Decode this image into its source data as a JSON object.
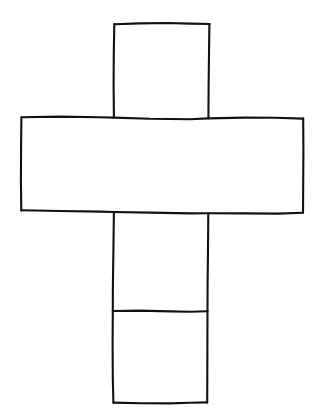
{
  "document": {
    "title": "Cube net drawing",
    "description": "Hand-drawn line figure of an unfolded cube (Latin cross net) composed of six squares",
    "background_color": "#ffffff",
    "ink_color": "#111111",
    "canvas": {
      "width": 315,
      "height": 418
    }
  },
  "figure": {
    "kind": "line-drawing",
    "layout": "latin-cross",
    "square_count": 6,
    "column_x": {
      "left": 113,
      "right": 208
    },
    "row_y": {
      "top": 23,
      "band_top": 118,
      "band_bottom": 212,
      "divider": 311,
      "bottom": 403
    },
    "band_x": {
      "left": 21,
      "right": 303
    },
    "stroke_width": 2.1,
    "faces": [
      {
        "name": "top-face",
        "label": "",
        "x": 113,
        "y": 23,
        "w": 96,
        "h": 95
      },
      {
        "name": "left-face",
        "label": "",
        "x": 21,
        "y": 117,
        "w": 92,
        "h": 95
      },
      {
        "name": "front-face",
        "label": "",
        "x": 113,
        "y": 118,
        "w": 95,
        "h": 94
      },
      {
        "name": "right-face",
        "label": "",
        "x": 208,
        "y": 118,
        "w": 95,
        "h": 94
      },
      {
        "name": "bottom-face",
        "label": "",
        "x": 113,
        "y": 212,
        "w": 95,
        "h": 99
      },
      {
        "name": "back-face",
        "label": "",
        "x": 113,
        "y": 311,
        "w": 94,
        "h": 92
      }
    ],
    "strokes": [
      {
        "name": "top-square-top-edge",
        "d": "M 114.5 24.2 L 140 23.4 L 168 23.0 L 190 23.6 L 209.5 24.0"
      },
      {
        "name": "top-square-left-edge",
        "d": "M 114.3 24.0 L 113.8 52 L 113.6 84 L 113.9 117.6"
      },
      {
        "name": "top-square-right-edge",
        "d": "M 209.4 24.0 L 209.0 54 L 208.6 88 L 208.4 118.2"
      },
      {
        "name": "band-top-edge",
        "d": "M 21.6 117.2 L 60 116.6 L 100 117.2 L 114 117.6 L 150 118.8 L 190 119.2 L 208 118.4 L 245 117.6 L 275 117.8 L 303.2 118.6"
      },
      {
        "name": "band-left-edge",
        "d": "M 21.4 117.2 L 21.1 145 L 20.9 180 L 21.3 210.6"
      },
      {
        "name": "band-right-edge",
        "d": "M 303.2 118.6 L 303.4 150 L 303.2 185 L 303.0 212.8"
      },
      {
        "name": "band-bottom-edge",
        "d": "M 21.3 210.2 L 60 211.0 L 100 211.6 L 113 212.0 L 150 212.6 L 190 213.4 L 208 213.2 L 245 213.4 L 278 213.6 L 303.0 212.8"
      },
      {
        "name": "lower-column-left-edge",
        "d": "M 113.9 212.0 L 113.4 250 L 112.9 285 L 112.8 311.0 L 112.6 345 L 112.8 378 L 113.4 402.6"
      },
      {
        "name": "lower-column-right-edge",
        "d": "M 208.3 213.2 L 208.0 250 L 207.6 285 L 207.5 311.2 L 207.4 345 L 207.3 378 L 207.2 402.4"
      },
      {
        "name": "interior-divider-edge",
        "d": "M 112.8 311.0 L 140 310.6 L 170 311.4 L 190 311.8 L 207.5 311.2"
      },
      {
        "name": "bottom-edge",
        "d": "M 113.4 402.6 L 140 403.2 L 170 403.4 L 190 402.8 L 207.2 402.4"
      }
    ]
  }
}
